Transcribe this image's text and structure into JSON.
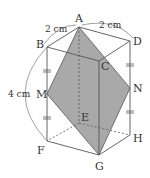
{
  "figure": {
    "vertices": {
      "A": {
        "label": "A",
        "x": 79,
        "y": 27
      },
      "B": {
        "label": "B",
        "x": 47,
        "y": 47
      },
      "C": {
        "label": "C",
        "x": 99,
        "y": 61
      },
      "D": {
        "label": "D",
        "x": 130,
        "y": 41
      },
      "E": {
        "label": "E",
        "x": 79,
        "y": 123
      },
      "F": {
        "label": "F",
        "x": 47,
        "y": 141
      },
      "G": {
        "label": "G",
        "x": 99,
        "y": 155
      },
      "H": {
        "label": "H",
        "x": 130,
        "y": 135
      },
      "M": {
        "label": "M",
        "x": 47,
        "y": 94
      },
      "N": {
        "label": "N",
        "x": 130,
        "y": 88
      }
    },
    "dimensions": {
      "ab": "2 cm",
      "ad": "2 cm",
      "bf": "4 cm"
    },
    "shaded_section": [
      "A",
      "M",
      "G",
      "N"
    ],
    "colors": {
      "shade": "#a9a9a9",
      "line": "#555555",
      "text": "#333333"
    }
  }
}
